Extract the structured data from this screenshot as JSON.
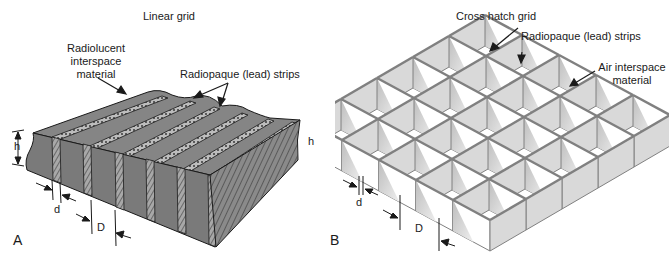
{
  "figure": {
    "panel_a": {
      "letter": "A",
      "title": "Linear grid",
      "callouts": {
        "interspace_line1": "Radiolucent",
        "interspace_line2": "interspace",
        "interspace_line3": "material",
        "strips": "Radiopaque (lead) strips"
      },
      "dimensions": {
        "height": "h",
        "strip_width": "d",
        "strip_period": "D"
      }
    },
    "panel_b": {
      "letter": "B",
      "title": "Cross hatch grid",
      "callouts": {
        "strips": "Radiopaque (lead) strips",
        "air_line1": "Air interspace",
        "air_line2": "material"
      },
      "dimensions": {
        "height": "h",
        "strip_width": "d",
        "strip_period": "D"
      }
    },
    "colors": {
      "linear_body": "#7a7a7a",
      "linear_top": "#808080",
      "strip_hatch": "#9a9a9a",
      "panel_fill": "#d9d9d9",
      "panel_edge": "#808080",
      "ink": "#1a1a1a"
    }
  }
}
